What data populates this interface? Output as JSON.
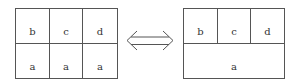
{
  "left_grid": {
    "top_row": [
      "b",
      "c",
      "d"
    ],
    "bottom_row": [
      "a",
      "a",
      "a"
    ]
  },
  "right_grid": {
    "top_row": [
      "b",
      "c",
      "d"
    ],
    "bottom_row": [
      "a"
    ]
  },
  "connector": {
    "type": "double-headed-arrow",
    "color": "#555555"
  },
  "colors": {
    "line": "#555555",
    "text": "#333333",
    "background": "#ffffff"
  }
}
